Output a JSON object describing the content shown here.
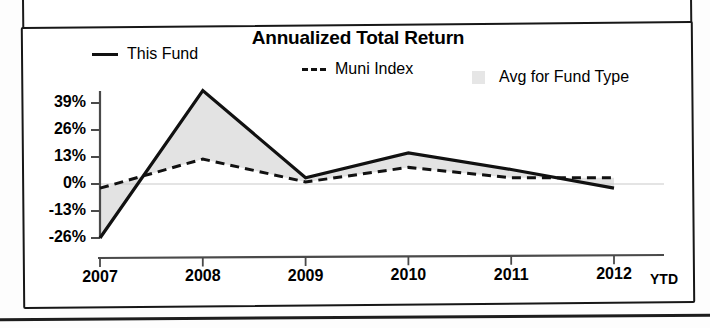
{
  "chart_title": "Annualized Total Return",
  "legend": [
    {
      "key": "this_fund",
      "label": "This Fund",
      "marker": "solid-line-swatch"
    },
    {
      "key": "muni_index",
      "label": "Muni Index",
      "marker": "dashed-line-swatch"
    },
    {
      "key": "avg_type",
      "label": "Avg for Fund Type",
      "marker": "area-fill-swatch"
    }
  ],
  "axis": {
    "y_ticks": [
      "39%",
      "26%",
      "13%",
      "0%",
      "-13%",
      "-26%"
    ],
    "x_ticks": [
      "2007",
      "2008",
      "2009",
      "2010",
      "2011",
      "2012"
    ],
    "x_suffix": "YTD"
  },
  "colors": {
    "line": "#111111",
    "area_fill": "#e2e2e2",
    "axis": "#4a4a4a",
    "frame": "#171717",
    "background": "#ffffff"
  },
  "chart_data": {
    "type": "line",
    "title": "Annualized Total Return",
    "xlabel": "",
    "ylabel": "",
    "x": [
      "2007",
      "2008",
      "2009",
      "2010",
      "2011",
      "2012"
    ],
    "categories": [
      "2007",
      "2008",
      "2009",
      "2010",
      "2011",
      "2012"
    ],
    "ylim": [
      -26,
      45
    ],
    "yticks": [
      -26,
      -13,
      0,
      13,
      26,
      39
    ],
    "ytick_labels": [
      "-26%",
      "-13%",
      "0%",
      "13%",
      "26%",
      "39%"
    ],
    "grid": false,
    "legend_position": "top",
    "note": "Last x point is 2012 YTD (year to date). Shaded band between the two lines denotes the Avg for Fund Type range.",
    "series": [
      {
        "name": "This Fund",
        "style": "solid",
        "values": [
          -26,
          45,
          3,
          15,
          7,
          -2
        ]
      },
      {
        "name": "Muni Index",
        "style": "dashed",
        "values": [
          -2,
          12,
          1,
          8,
          3,
          3
        ]
      }
    ]
  }
}
